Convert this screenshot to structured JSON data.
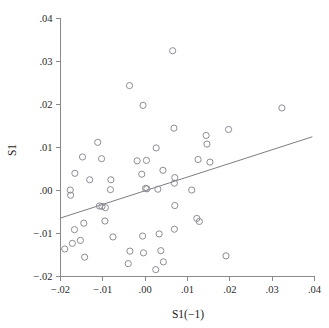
{
  "chart_data": {
    "type": "scatter",
    "title": "",
    "subtitle": "",
    "xlabel": "S1(−1)",
    "ylabel": "S1",
    "xlim": [
      -0.02,
      0.04
    ],
    "ylim": [
      -0.02,
      0.04
    ],
    "grid": false,
    "legend": "none",
    "xticks": [
      -0.02,
      -0.01,
      0.0,
      0.01,
      0.02,
      0.03,
      0.04
    ],
    "xticklabels": [
      "−.02",
      "−.01",
      ".00",
      ".01",
      ".02",
      ".03",
      ".04"
    ],
    "yticks": [
      -0.02,
      -0.01,
      0.0,
      0.01,
      0.02,
      0.03,
      0.04
    ],
    "yticklabels": [
      "−.02",
      "−.01",
      ".00",
      ".01",
      ".02",
      ".03",
      ".04"
    ],
    "marker": "open-circle",
    "marker_size": 3.1,
    "marker_color": "#8d8d96",
    "line_color": "#7d7d86",
    "axis_color": "#8a8a8a",
    "background": "#ffffff",
    "series": [
      {
        "name": "S1 vs S1(−1)",
        "points": [
          [
            0.0065,
            0.0325
          ],
          [
            -0.0037,
            0.0244
          ],
          [
            -0.0005,
            0.0198
          ],
          [
            0.0323,
            0.0192
          ],
          [
            0.0068,
            0.0145
          ],
          [
            0.0197,
            0.0142
          ],
          [
            0.0144,
            0.0128
          ],
          [
            -0.0112,
            0.0112
          ],
          [
            0.0146,
            0.0108
          ],
          [
            0.0026,
            0.0099
          ],
          [
            -0.0148,
            0.0078
          ],
          [
            -0.0103,
            0.0074
          ],
          [
            0.0125,
            0.0072
          ],
          [
            -0.0019,
            0.0069
          ],
          [
            0.0003,
            0.007
          ],
          [
            0.0153,
            0.0066
          ],
          [
            0.0042,
            0.0047
          ],
          [
            -0.0166,
            0.004
          ],
          [
            -0.0008,
            0.0038
          ],
          [
            -0.0131,
            0.0025
          ],
          [
            -0.0081,
            0.0025
          ],
          [
            0.007,
            0.003
          ],
          [
            0.0069,
            0.0017
          ],
          [
            0.0001,
            0.0005
          ],
          [
            0.0004,
            0.0004
          ],
          [
            0.003,
            0.0003
          ],
          [
            -0.0082,
            0.0002
          ],
          [
            -0.0177,
            0.0001
          ],
          [
            0.011,
            0.0001
          ],
          [
            -0.0176,
            -0.0011
          ],
          [
            -0.0108,
            -0.0036
          ],
          [
            -0.0102,
            -0.0037
          ],
          [
            -0.0094,
            -0.004
          ],
          [
            0.007,
            -0.0035
          ],
          [
            0.0122,
            -0.0065
          ],
          [
            -0.0145,
            -0.0076
          ],
          [
            -0.0095,
            -0.0071
          ],
          [
            0.0128,
            -0.0072
          ],
          [
            -0.0167,
            -0.0091
          ],
          [
            0.0069,
            -0.009
          ],
          [
            0.0033,
            -0.0101
          ],
          [
            -0.0006,
            -0.0106
          ],
          [
            -0.0076,
            -0.0108
          ],
          [
            -0.0153,
            -0.0116
          ],
          [
            -0.0172,
            -0.0123
          ],
          [
            -0.019,
            -0.0136
          ],
          [
            -0.0036,
            -0.0141
          ],
          [
            0.0037,
            -0.014
          ],
          [
            -0.0004,
            -0.0145
          ],
          [
            0.0191,
            -0.0152
          ],
          [
            -0.0143,
            -0.0155
          ],
          [
            0.0043,
            -0.0166
          ],
          [
            -0.004,
            -0.017
          ],
          [
            0.0025,
            -0.0184
          ]
        ]
      }
    ],
    "fit_line": {
      "name": "regression-line",
      "x_start": -0.02,
      "y_start": -0.0064,
      "x_end": 0.0395,
      "y_end": 0.0125
    }
  }
}
